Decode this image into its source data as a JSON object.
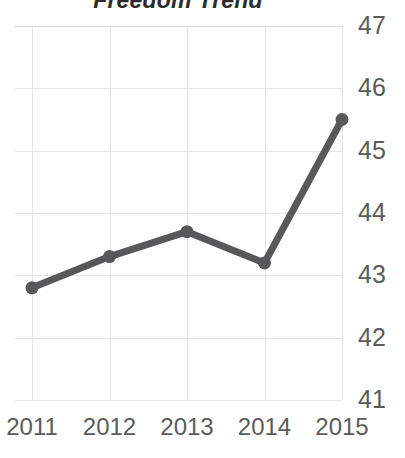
{
  "chart_data": {
    "type": "line",
    "title": "Freedom Trend",
    "xlabel": "",
    "ylabel": "",
    "categories": [
      "2011",
      "2012",
      "2013",
      "2014",
      "2015"
    ],
    "values": [
      42.8,
      43.3,
      43.7,
      43.2,
      45.5
    ],
    "series": [
      {
        "name": "Freedom Trend",
        "values": [
          42.8,
          43.3,
          43.7,
          43.2,
          45.5
        ]
      }
    ],
    "x": [
      2011,
      2012,
      2013,
      2014,
      2015
    ],
    "ylim": [
      41,
      47
    ],
    "xlim": [
      2011,
      2015
    ],
    "yticks": [
      41,
      42,
      43,
      44,
      45,
      46,
      47
    ],
    "ytick_labels": [
      "41",
      "42",
      "43",
      "44",
      "45",
      "46",
      "47"
    ],
    "xtick_labels": [
      "2011",
      "2012",
      "2013",
      "2014",
      "2015"
    ],
    "y_axis_position": "right",
    "grid": true,
    "legend": false,
    "legend_position": "none",
    "markers": true,
    "line_color": "#58585a",
    "marker_color": "#58585a",
    "grid_color": "#e6e6e6",
    "tick_label_color": "#5b5b5b",
    "title_color": "#2b2b2b",
    "background_color": "#ffffff"
  }
}
